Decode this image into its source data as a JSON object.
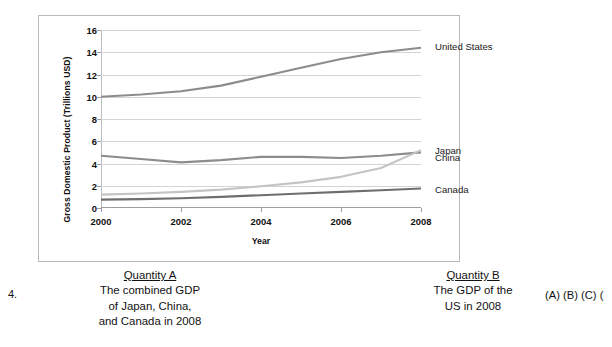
{
  "chart_data": {
    "type": "line",
    "title": "",
    "xlabel": "Year",
    "ylabel": "Gross Domestic Product (Trillions USD)",
    "x": [
      2000,
      2001,
      2002,
      2003,
      2004,
      2005,
      2006,
      2007,
      2008
    ],
    "xticks": [
      "2000",
      "2002",
      "2004",
      "2006",
      "2008"
    ],
    "yticks": [
      "0",
      "2",
      "4",
      "6",
      "8",
      "10",
      "12",
      "14",
      "16"
    ],
    "ylim": [
      0,
      16
    ],
    "xlim": [
      2000,
      2008
    ],
    "grid": true,
    "legend_position": "right-inline",
    "series": [
      {
        "name": "United States",
        "color": "#8c8c8c",
        "values": [
          10.0,
          10.2,
          10.5,
          11.0,
          11.8,
          12.6,
          13.4,
          14.0,
          14.4
        ],
        "label_value": 14.4
      },
      {
        "name": "Japan",
        "color": "#8c8c8c",
        "values": [
          4.7,
          4.4,
          4.1,
          4.3,
          4.6,
          4.6,
          4.5,
          4.7,
          5.0
        ],
        "label_value": 5.0
      },
      {
        "name": "China",
        "color": "#c4c4c4",
        "values": [
          1.2,
          1.3,
          1.45,
          1.65,
          1.95,
          2.3,
          2.8,
          3.6,
          5.2
        ],
        "label_value": 5.2
      },
      {
        "name": "Canada",
        "color": "#6e6e6e",
        "values": [
          0.75,
          0.8,
          0.88,
          1.0,
          1.15,
          1.3,
          1.45,
          1.6,
          1.75
        ],
        "label_value": 1.75
      }
    ]
  },
  "question": {
    "number": "4.",
    "quantity_a": {
      "heading": "Quantity A",
      "lines": [
        "The combined GDP",
        "of Japan, China,",
        "and Canada in 2008"
      ]
    },
    "quantity_b": {
      "heading": "Quantity B",
      "lines": [
        "The GDP of the",
        "US in 2008"
      ]
    },
    "answer_choices": "(A) (B) (C) ("
  }
}
